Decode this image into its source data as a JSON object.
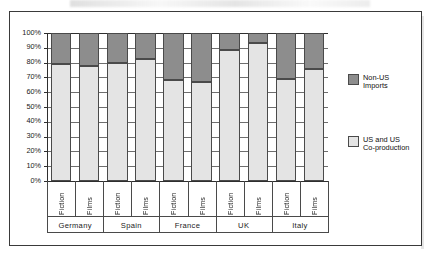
{
  "chart_data": {
    "type": "bar",
    "subtype": "stacked-100-percent",
    "title": "",
    "xlabel": "",
    "ylabel": "",
    "ylim": [
      0,
      100
    ],
    "ytick_labels": [
      "100%",
      "90%",
      "80%",
      "70%",
      "60%",
      "50%",
      "40%",
      "30%",
      "20%",
      "10%",
      "0%"
    ],
    "ytick_values": [
      100,
      90,
      80,
      70,
      60,
      50,
      40,
      30,
      20,
      10,
      0
    ],
    "grid": true,
    "legend_position": "right",
    "groups": [
      "Germany",
      "Spain",
      "France",
      "UK",
      "Italy"
    ],
    "categories": [
      "Fiction",
      "Films",
      "Fiction",
      "Films",
      "Fiction",
      "Films",
      "Fiction",
      "Films",
      "Fiction",
      "Films"
    ],
    "series": [
      {
        "name": "US and US Co-production",
        "color": "#e4e4e4",
        "values": [
          79,
          77.5,
          79.5,
          82.5,
          68,
          67,
          88.5,
          93.5,
          69,
          76
        ]
      },
      {
        "name": "Non-US Imports",
        "color": "#8d8d8d",
        "values": [
          21,
          22.5,
          20.5,
          17.5,
          32,
          33,
          11.5,
          6.5,
          31,
          24
        ]
      }
    ],
    "legend": [
      {
        "label_line1": "Non-US",
        "label_line2": "Imports",
        "color": "#8d8d8d"
      },
      {
        "label_line1": "US and US",
        "label_line2": "Co-production",
        "color": "#e4e4e4"
      }
    ]
  }
}
